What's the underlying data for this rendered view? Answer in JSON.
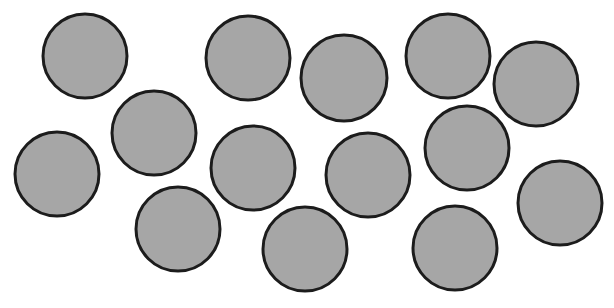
{
  "canvas": {
    "width": 614,
    "height": 308,
    "background": "#ffffff"
  },
  "style": {
    "fill": "#a6a6a6",
    "stroke": "#1c1c1c",
    "stroke_width": 3
  },
  "circles": [
    {
      "cx": 85,
      "cy": 56,
      "r": 42
    },
    {
      "cx": 57,
      "cy": 174,
      "r": 42
    },
    {
      "cx": 154,
      "cy": 133,
      "r": 42
    },
    {
      "cx": 178,
      "cy": 229,
      "r": 42
    },
    {
      "cx": 248,
      "cy": 58,
      "r": 42
    },
    {
      "cx": 253,
      "cy": 168,
      "r": 42
    },
    {
      "cx": 305,
      "cy": 249,
      "r": 42
    },
    {
      "cx": 344,
      "cy": 78,
      "r": 43
    },
    {
      "cx": 368,
      "cy": 175,
      "r": 42
    },
    {
      "cx": 448,
      "cy": 56,
      "r": 42
    },
    {
      "cx": 467,
      "cy": 148,
      "r": 42
    },
    {
      "cx": 455,
      "cy": 248,
      "r": 42
    },
    {
      "cx": 536,
      "cy": 84,
      "r": 42
    },
    {
      "cx": 560,
      "cy": 203,
      "r": 42
    }
  ]
}
